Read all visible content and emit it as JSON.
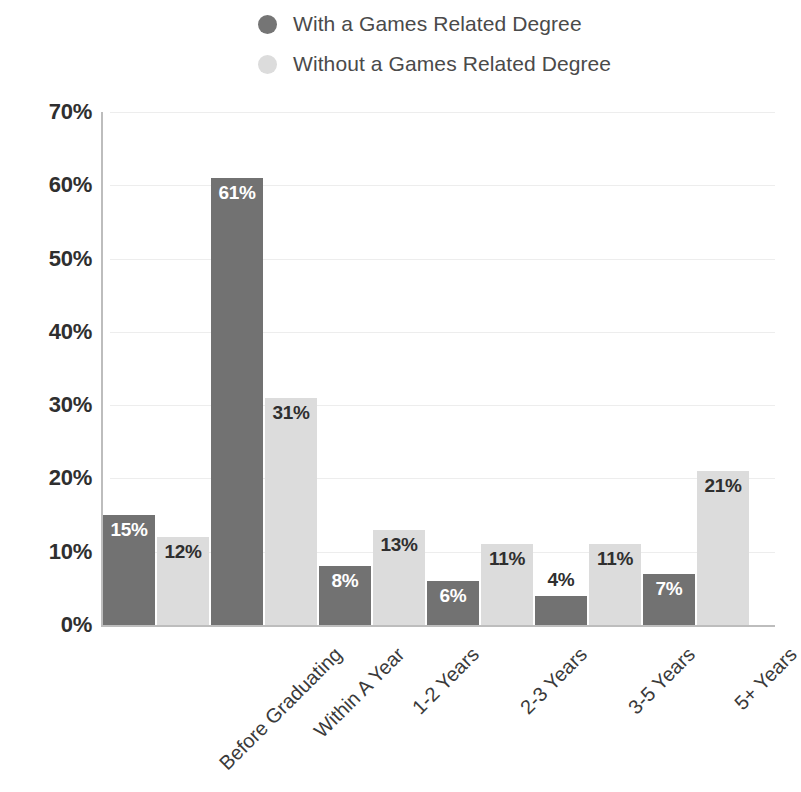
{
  "legend": {
    "items": [
      {
        "label": "With a Games Related Degree",
        "color": "#757575",
        "key": "with"
      },
      {
        "label": "Without a Games Related Degree",
        "color": "#dcdcdc",
        "key": "without"
      }
    ]
  },
  "axis": {
    "y_ticks": [
      "0%",
      "10%",
      "20%",
      "30%",
      "40%",
      "50%",
      "60%",
      "70%"
    ]
  },
  "colors": {
    "series_with": "#727272",
    "series_without": "#dcdcdc",
    "gridline": "#ededed",
    "axis": "#bdbdbd",
    "label_dark": "#2f2f2f",
    "label_light": "#ffffff"
  },
  "chart_data": {
    "type": "bar",
    "title": "",
    "xlabel": "",
    "ylabel": "",
    "ylim": [
      0,
      70
    ],
    "ytick_step": 10,
    "grid": true,
    "legend_position": "top",
    "value_suffix": "%",
    "categories": [
      "Before Graduating",
      "Within A Year",
      "1-2 Years",
      "2-3 Years",
      "3-5 Years",
      "5+ Years"
    ],
    "series": [
      {
        "name": "With a Games Related Degree",
        "color": "#727272",
        "values": [
          15,
          61,
          8,
          6,
          4,
          7
        ],
        "labels": [
          "15%",
          "61%",
          "8%",
          "6%",
          "4%",
          "7%"
        ]
      },
      {
        "name": "Without a Games Related Degree",
        "color": "#dcdcdc",
        "values": [
          12,
          31,
          13,
          11,
          11,
          21
        ],
        "labels": [
          "12%",
          "31%",
          "13%",
          "11%",
          "11%",
          "21%"
        ]
      }
    ]
  }
}
